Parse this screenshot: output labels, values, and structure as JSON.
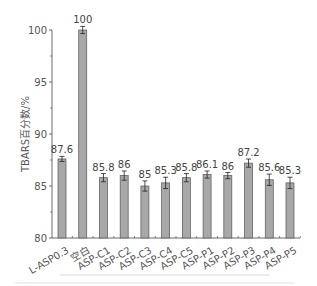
{
  "chart_data": {
    "type": "bar",
    "title": "",
    "xlabel": "",
    "ylabel": "TBARS百分数/%",
    "ylim": [
      80,
      100
    ],
    "yticks": [
      80,
      85,
      90,
      95,
      100
    ],
    "grid": false,
    "legend": null,
    "categories": [
      "L-ASP0.3",
      "空白",
      "ASP-C1",
      "ASP-C2",
      "ASP-C3",
      "ASP-C4",
      "ASP-C5",
      "ASP-P1",
      "ASP-P2",
      "ASP-P3",
      "ASP-P4",
      "ASP-P5"
    ],
    "values": [
      87.6,
      100,
      85.8,
      86,
      85,
      85.3,
      85.8,
      86.1,
      86,
      87.2,
      85.6,
      85.3
    ],
    "value_labels": [
      "87.6",
      "100",
      "85.8",
      "86",
      "85",
      "85.3",
      "85.8",
      "86.1",
      "86",
      "87.2",
      "85.6",
      "85.3"
    ],
    "error_bars": [
      0.1,
      0.2,
      0.25,
      0.3,
      0.35,
      0.4,
      0.25,
      0.2,
      0.15,
      0.25,
      0.4,
      0.4
    ],
    "bar_color": "#a8a8a8",
    "bar_edge_color": "#555555"
  }
}
